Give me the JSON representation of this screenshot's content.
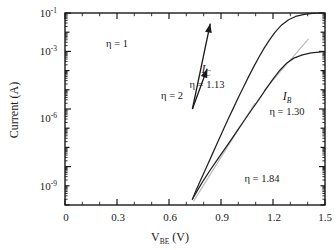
{
  "chart_data": {
    "type": "line",
    "title": "",
    "xlabel": "V_BE  (V)",
    "ylabel": "Current (A)",
    "xlim": [
      0,
      1.5
    ],
    "ylim_exponents": [
      -11,
      -1
    ],
    "yscale": "log",
    "grid": false,
    "legend": "none",
    "xticks": [
      0,
      0.3,
      0.6,
      0.9,
      1.2,
      1.5
    ],
    "xtick_labels": [
      "0",
      "0.3",
      "0.6",
      "0.9",
      "1.2",
      "1.5"
    ],
    "ytick_exponents": [
      -1,
      -3,
      -6,
      -9
    ],
    "ytick_labels": [
      "10-1",
      "10-3",
      "10-6",
      "10-9"
    ],
    "series": [
      {
        "name": "I_C",
        "ideality": 1.13,
        "points": [
          [
            0.735,
            -10.7
          ],
          [
            0.76,
            -10.15
          ],
          [
            0.79,
            -9.55
          ],
          [
            0.82,
            -8.95
          ],
          [
            0.85,
            -8.35
          ],
          [
            0.88,
            -7.75
          ],
          [
            0.91,
            -7.15
          ],
          [
            0.94,
            -6.55
          ],
          [
            0.97,
            -5.98
          ],
          [
            1.0,
            -5.4
          ],
          [
            1.03,
            -4.85
          ],
          [
            1.06,
            -4.3
          ],
          [
            1.09,
            -3.78
          ],
          [
            1.12,
            -3.28
          ],
          [
            1.15,
            -2.82
          ],
          [
            1.18,
            -2.4
          ],
          [
            1.21,
            -2.02
          ],
          [
            1.25,
            -1.62
          ],
          [
            1.29,
            -1.35
          ],
          [
            1.33,
            -1.18
          ],
          [
            1.38,
            -1.07
          ],
          [
            1.43,
            -1.02
          ],
          [
            1.48,
            -1.0
          ]
        ]
      },
      {
        "name": "I_B",
        "ideality": 1.3,
        "points": [
          [
            0.735,
            -10.7
          ],
          [
            0.77,
            -10.15
          ],
          [
            0.8,
            -9.7
          ],
          [
            0.84,
            -9.15
          ],
          [
            0.88,
            -8.62
          ],
          [
            0.92,
            -8.1
          ],
          [
            0.96,
            -7.58
          ],
          [
            1.0,
            -7.05
          ],
          [
            1.04,
            -6.52
          ],
          [
            1.08,
            -6.0
          ],
          [
            1.12,
            -5.48
          ],
          [
            1.16,
            -4.95
          ],
          [
            1.2,
            -4.45
          ],
          [
            1.24,
            -3.98
          ],
          [
            1.28,
            -3.6
          ],
          [
            1.32,
            -3.35
          ],
          [
            1.37,
            -3.18
          ],
          [
            1.42,
            -3.08
          ],
          [
            1.48,
            -3.02
          ]
        ]
      }
    ],
    "fit_lines": [
      {
        "label": "n = 1.84",
        "ideality": 1.84,
        "from": [
          0.742,
          -10.8
        ],
        "to": [
          1.095,
          -5.7
        ]
      },
      {
        "label": "n = 1.30",
        "ideality": 1.3,
        "from": [
          1.148,
          -5.05
        ],
        "to": [
          1.405,
          -2.35
        ]
      }
    ],
    "slope_arrows": [
      {
        "label": "n = 1",
        "ideality": 1,
        "from": [
          0.735,
          -6.0
        ],
        "to": [
          0.838,
          -1.55
        ]
      },
      {
        "label": "n = 2",
        "ideality": 2,
        "from": [
          0.735,
          -6.0
        ],
        "to": [
          0.82,
          -3.9
        ]
      }
    ],
    "annotations": [
      {
        "name": "eta-1",
        "text": "η = 1",
        "x": 0.5,
        "y_exp": -2.15
      },
      {
        "name": "eta-2",
        "text": "η = 2",
        "x": 0.795,
        "y_exp": -4.45
      },
      {
        "name": "ic-eta",
        "text": "η = 1.13",
        "x": 0.98,
        "y_exp": -3.3
      },
      {
        "name": "ib-eta",
        "text": "η = 1.30",
        "x": 1.3,
        "y_exp": -5.05
      },
      {
        "name": "fit-eta",
        "text": "η = 1.84",
        "x": 1.18,
        "y_exp": -9.3
      }
    ]
  },
  "labels": {
    "y_axis_title": "Current (A)",
    "x_axis_title_main": "V",
    "x_axis_title_sub": "BE",
    "x_axis_title_unit": "(V)",
    "ic_symbol": "I",
    "ic_subscript": "C",
    "ib_symbol": "I",
    "ib_subscript": "B",
    "eta_1": "η = 1",
    "eta_2": "η = 2",
    "eta_ic": "η = 1.13",
    "eta_ib": "η = 1.30",
    "eta_fit": "η = 1.84",
    "ytick_1": "10",
    "ytick_1_exp": "-1",
    "ytick_2": "10",
    "ytick_2_exp": "-3",
    "ytick_3": "10",
    "ytick_3_exp": "-6",
    "ytick_4": "10",
    "ytick_4_exp": "-9",
    "xtick_0": "0",
    "xtick_1": "0.3",
    "xtick_2": "0.6",
    "xtick_3": "0.9",
    "xtick_4": "1.2",
    "xtick_5": "1.5"
  },
  "colors": {
    "curve": "#222222",
    "fit": "#b9b9b9",
    "axis": "#1a1a1a",
    "background": "#ffffff"
  }
}
